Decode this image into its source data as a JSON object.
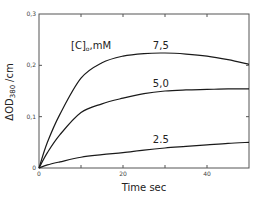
{
  "chart_data": {
    "type": "line",
    "title": "",
    "xlabel": "Time sec",
    "ylabel": "ΔOD380 /cm",
    "ylabel_main": "ΔOD",
    "ylabel_sub": "380",
    "ylabel_unit": "/cm",
    "legend_title": "[C]o,mM",
    "legend_title_main": "[C]",
    "legend_title_sub": "o",
    "legend_title_unit": ",mM",
    "xlim": [
      0,
      50
    ],
    "ylim": [
      0,
      0.3
    ],
    "grid": false,
    "x_ticks": [
      0,
      10,
      20,
      30,
      40
    ],
    "x_tick_labels": [
      "0",
      "",
      "20",
      "",
      "40"
    ],
    "y_ticks": [
      0,
      0.1,
      0.2,
      0.3
    ],
    "y_tick_labels": [
      "0",
      "0,1",
      "0,2",
      "0,3"
    ],
    "series": [
      {
        "name": "7,5",
        "x": [
          0,
          2,
          5,
          10,
          15,
          20,
          25,
          30,
          35,
          40,
          45,
          50
        ],
        "values": [
          0,
          0.05,
          0.105,
          0.175,
          0.205,
          0.218,
          0.223,
          0.224,
          0.222,
          0.218,
          0.211,
          0.202
        ]
      },
      {
        "name": "5,0",
        "x": [
          0,
          2,
          5,
          10,
          15,
          20,
          25,
          30,
          35,
          40,
          45,
          50
        ],
        "values": [
          0,
          0.03,
          0.065,
          0.108,
          0.125,
          0.136,
          0.145,
          0.15,
          0.152,
          0.153,
          0.154,
          0.154
        ]
      },
      {
        "name": "2.5",
        "x": [
          0,
          2,
          5,
          10,
          15,
          20,
          25,
          30,
          35,
          40,
          45,
          50
        ],
        "values": [
          0,
          0.006,
          0.012,
          0.021,
          0.026,
          0.03,
          0.035,
          0.039,
          0.042,
          0.045,
          0.048,
          0.05
        ]
      }
    ],
    "curve_labels": [
      {
        "text": "7,5",
        "x": 29,
        "y": 0.232
      },
      {
        "text": "5,0",
        "x": 29,
        "y": 0.157
      },
      {
        "text": "2.5",
        "x": 29,
        "y": 0.048
      }
    ]
  }
}
